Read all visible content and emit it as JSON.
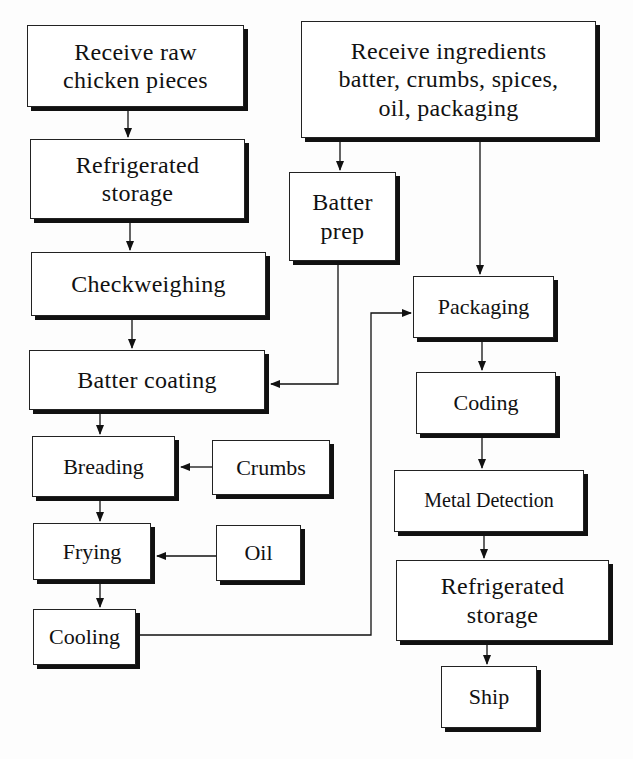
{
  "diagram": {
    "type": "process-flowchart",
    "nodes": [
      {
        "id": "receive_raw",
        "label": "Receive raw\nchicken pieces"
      },
      {
        "id": "receive_ingredients",
        "label": "Receive ingredients\nbatter, crumbs, spices,\noil, packaging"
      },
      {
        "id": "refrigerated_storage_1",
        "label": "Refrigerated\nstorage"
      },
      {
        "id": "batter_prep",
        "label": "Batter\nprep"
      },
      {
        "id": "checkweighing",
        "label": "Checkweighing"
      },
      {
        "id": "packaging",
        "label": "Packaging"
      },
      {
        "id": "batter_coating",
        "label": "Batter coating"
      },
      {
        "id": "coding",
        "label": "Coding"
      },
      {
        "id": "breading",
        "label": "Breading"
      },
      {
        "id": "crumbs",
        "label": "Crumbs"
      },
      {
        "id": "metal_detection",
        "label": "Metal Detection"
      },
      {
        "id": "frying",
        "label": "Frying"
      },
      {
        "id": "oil",
        "label": "Oil"
      },
      {
        "id": "refrigerated_storage_2",
        "label": "Refrigerated\nstorage"
      },
      {
        "id": "cooling",
        "label": "Cooling"
      },
      {
        "id": "ship",
        "label": "Ship"
      }
    ],
    "edges": [
      {
        "from": "receive_raw",
        "to": "refrigerated_storage_1"
      },
      {
        "from": "refrigerated_storage_1",
        "to": "checkweighing"
      },
      {
        "from": "checkweighing",
        "to": "batter_coating"
      },
      {
        "from": "batter_coating",
        "to": "breading"
      },
      {
        "from": "crumbs",
        "to": "breading"
      },
      {
        "from": "breading",
        "to": "frying"
      },
      {
        "from": "oil",
        "to": "frying"
      },
      {
        "from": "frying",
        "to": "cooling"
      },
      {
        "from": "receive_ingredients",
        "to": "batter_prep"
      },
      {
        "from": "batter_prep",
        "to": "batter_coating"
      },
      {
        "from": "receive_ingredients",
        "to": "packaging"
      },
      {
        "from": "cooling",
        "to": "packaging"
      },
      {
        "from": "packaging",
        "to": "coding"
      },
      {
        "from": "coding",
        "to": "metal_detection"
      },
      {
        "from": "metal_detection",
        "to": "refrigerated_storage_2"
      },
      {
        "from": "refrigerated_storage_2",
        "to": "ship"
      }
    ]
  },
  "colors": {
    "line": "#111111",
    "box_fill": "#ffffff",
    "shadow": "#111111",
    "background": "#fdfdfd"
  }
}
